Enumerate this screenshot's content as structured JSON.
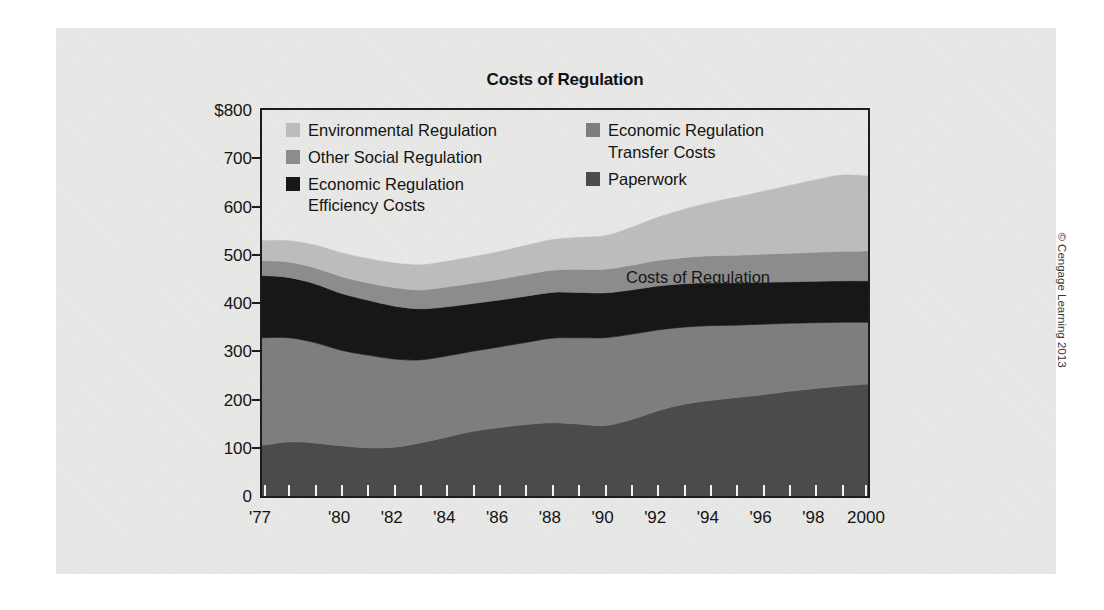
{
  "figure": {
    "title": "Costs of Regulation",
    "annotation": "Costs of Regulation",
    "copyright": "© Cengage Learning 2013",
    "panel_color": "#e9e9e7",
    "frame_color": "#1c1c1c"
  },
  "legend": {
    "left_column": [
      {
        "label": "Environmental Regulation",
        "label_line2": "",
        "color": "#bcbcbc",
        "swatch": true
      },
      {
        "label": "Other Social Regulation",
        "label_line2": "",
        "color": "#8c8c8c",
        "swatch": true
      },
      {
        "label": "Economic Regulation",
        "label_line2": "Efficiency Costs",
        "color": "#171717",
        "swatch": true
      }
    ],
    "right_column": [
      {
        "label": "Economic Regulation",
        "label_line2": "Transfer Costs",
        "color": "#7e7e7e",
        "swatch": true
      },
      {
        "label": "Paperwork",
        "label_line2": "",
        "color": "#4b4b4b",
        "swatch": true
      }
    ]
  },
  "chart_data": {
    "type": "area",
    "stacked": true,
    "title": "Costs of Regulation",
    "xlabel": "",
    "ylabel": "",
    "ylim": [
      0,
      800
    ],
    "y_unit": "billions of dollars",
    "grid": false,
    "legend_position": "inside-top-left",
    "y_ticks": [
      0,
      100,
      200,
      300,
      400,
      500,
      600,
      700,
      800
    ],
    "y_tick_labels": [
      "0",
      "100",
      "200",
      "300",
      "400",
      "500",
      "600",
      "700",
      "$800"
    ],
    "x": [
      1977,
      1978,
      1979,
      1980,
      1981,
      1982,
      1983,
      1984,
      1985,
      1986,
      1987,
      1988,
      1989,
      1990,
      1991,
      1992,
      1993,
      1994,
      1995,
      1996,
      1997,
      1998,
      1999,
      2000
    ],
    "x_tick_labels": [
      "'77",
      "",
      "",
      "'80",
      "",
      "'82",
      "",
      "'84",
      "",
      "'86",
      "",
      "'88",
      "",
      "'90",
      "",
      "'92",
      "",
      "'94",
      "",
      "'96",
      "",
      "'98",
      "",
      "2000"
    ],
    "series": [
      {
        "name": "Paperwork",
        "color": "#4b4b4b",
        "values": [
          105,
          112,
          110,
          104,
          100,
          101,
          110,
          122,
          134,
          142,
          148,
          152,
          149,
          146,
          158,
          176,
          190,
          198,
          204,
          210,
          217,
          223,
          228,
          232
        ]
      },
      {
        "name": "Economic Regulation Transfer Costs",
        "color": "#7e7e7e",
        "values": [
          223,
          216,
          208,
          198,
          192,
          183,
          172,
          168,
          166,
          167,
          170,
          175,
          179,
          182,
          177,
          168,
          160,
          155,
          150,
          146,
          141,
          136,
          132,
          128
        ]
      },
      {
        "name": "Economic Regulation Efficiency Costs",
        "color": "#171717",
        "values": [
          129,
          125,
          122,
          118,
          114,
          110,
          106,
          102,
          99,
          97,
          96,
          95,
          94,
          93,
          92,
          91,
          90,
          89,
          88,
          87,
          86,
          86,
          86,
          86
        ]
      },
      {
        "name": "Other Social Regulation",
        "color": "#8c8c8c",
        "values": [
          31,
          32,
          33,
          35,
          36,
          38,
          39,
          41,
          42,
          43,
          45,
          46,
          48,
          49,
          51,
          53,
          54,
          56,
          57,
          58,
          59,
          60,
          61,
          62
        ]
      },
      {
        "name": "Environmental Regulation",
        "color": "#bcbcbc",
        "values": [
          41,
          44,
          47,
          49,
          50,
          51,
          52,
          53,
          55,
          57,
          60,
          63,
          66,
          69,
          78,
          89,
          100,
          110,
          120,
          130,
          140,
          150,
          158,
          155
        ]
      }
    ],
    "totals": [
      529,
      529,
      520,
      504,
      492,
      483,
      479,
      486,
      496,
      506,
      519,
      531,
      536,
      539,
      556,
      577,
      594,
      608,
      619,
      631,
      643,
      655,
      665,
      663
    ]
  }
}
